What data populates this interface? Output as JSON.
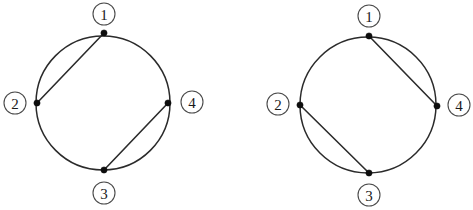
{
  "figure": {
    "background_color": "#ffffff",
    "stroke_color": "#2b2b2b",
    "node_color": "#0d0d0d",
    "label_text_color": "#1a1a1a",
    "diagram_count": 2
  },
  "diagrams": [
    {
      "name": "left-chord-diagram",
      "circle": {
        "cx": 103,
        "cy": 103,
        "r": 67
      },
      "nodes": [
        {
          "id": "1",
          "label": "①",
          "x": 104,
          "y": 33,
          "label_x": 104,
          "label_y": 14,
          "position": "top"
        },
        {
          "id": "2",
          "label": "②",
          "x": 37,
          "y": 103,
          "label_x": 15,
          "label_y": 103,
          "position": "left"
        },
        {
          "id": "3",
          "label": "③",
          "x": 104,
          "y": 170,
          "label_x": 104,
          "label_y": 193,
          "position": "bottom"
        },
        {
          "id": "4",
          "label": "④",
          "x": 168,
          "y": 103,
          "label_x": 192,
          "label_y": 102,
          "position": "right"
        }
      ],
      "chords": [
        {
          "from": "1",
          "to": "2"
        },
        {
          "from": "3",
          "to": "4"
        }
      ]
    },
    {
      "name": "right-chord-diagram",
      "circle": {
        "cx": 132,
        "cy": 105,
        "r": 68
      },
      "nodes": [
        {
          "id": "1",
          "label": "①",
          "x": 133,
          "y": 36,
          "label_x": 133,
          "label_y": 16,
          "position": "top"
        },
        {
          "id": "2",
          "label": "②",
          "x": 64,
          "y": 105,
          "label_x": 42,
          "label_y": 104,
          "position": "left"
        },
        {
          "id": "3",
          "label": "③",
          "x": 133,
          "y": 173,
          "label_x": 133,
          "label_y": 195,
          "position": "bottom"
        },
        {
          "id": "4",
          "label": "④",
          "x": 201,
          "y": 106,
          "label_x": 223,
          "label_y": 105,
          "position": "right"
        }
      ],
      "chords": [
        {
          "from": "1",
          "to": "4"
        },
        {
          "from": "2",
          "to": "3"
        }
      ]
    }
  ]
}
